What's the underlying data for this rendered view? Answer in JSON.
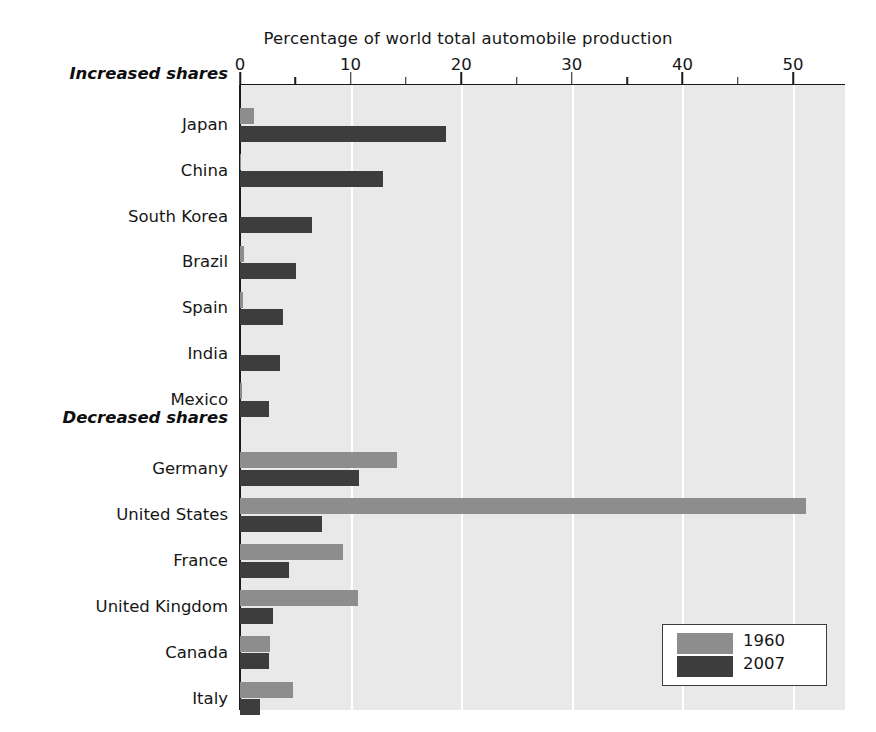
{
  "chart_data": {
    "type": "bar",
    "orientation": "horizontal",
    "title": "Percentage of world total automobile production",
    "xlabel": "",
    "ylabel": "",
    "xlim": [
      0,
      54.7
    ],
    "xticks": [
      0,
      10,
      20,
      30,
      40,
      50
    ],
    "xtick_labels": [
      "0",
      "10",
      "20",
      "30",
      "40",
      "50"
    ],
    "minor_tick_interval": 5,
    "grid": "vertical-white-at-major-ticks",
    "legend_position": "bottom-right",
    "categories": [
      "Japan",
      "China",
      "South Korea",
      "Brazil",
      "Spain",
      "India",
      "Mexico",
      "Germany",
      "United States",
      "France",
      "United Kingdom",
      "Canada",
      "Italy"
    ],
    "group_labels": [
      {
        "label": "Increased shares",
        "before_category": "Japan"
      },
      {
        "label": "Decreased shares",
        "before_category": "Germany"
      }
    ],
    "series": [
      {
        "name": "1960",
        "color": "#8d8d8d",
        "values": [
          1.3,
          0.1,
          0.0,
          0.4,
          0.3,
          0.0,
          0.2,
          14.2,
          51.2,
          9.3,
          10.7,
          2.7,
          4.8
        ]
      },
      {
        "name": "2007",
        "color": "#3d3d3d",
        "values": [
          18.6,
          12.9,
          6.5,
          5.1,
          3.9,
          3.6,
          2.6,
          10.8,
          7.4,
          4.4,
          3.0,
          2.6,
          1.8
        ]
      }
    ],
    "legend": [
      {
        "label": "1960",
        "color": "#8d8d8d"
      },
      {
        "label": "2007",
        "color": "#3d3d3d"
      }
    ],
    "plot_background": "#e9e9e9",
    "axis_color": "#1a1a1a"
  }
}
